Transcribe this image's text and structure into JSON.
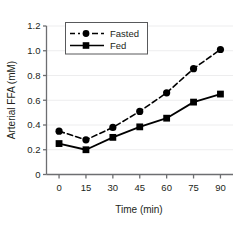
{
  "chart_data": {
    "type": "line",
    "title": "",
    "xlabel": "Time (min)",
    "ylabel": "Arterial FFA  (mM)",
    "x": [
      0,
      15,
      30,
      45,
      60,
      75,
      90
    ],
    "xtick_labels": [
      "0",
      "15",
      "30",
      "45",
      "60",
      "75",
      "90"
    ],
    "ytick_labels": [
      "0",
      "0.2",
      "0.4",
      "0.6",
      "0.8",
      "1.0",
      "1.2"
    ],
    "ytick_values": [
      0,
      0.2,
      0.4,
      0.6,
      0.8,
      1.0,
      1.2
    ],
    "xlim": [
      -7,
      97
    ],
    "ylim": [
      0,
      1.2
    ],
    "grid": "horizontal-faint",
    "legend_position": "upper-left-inside",
    "series": [
      {
        "name": "Fasted",
        "values": [
          0.35,
          0.28,
          0.38,
          0.51,
          0.66,
          0.855,
          1.01
        ],
        "linestyle": "dashed",
        "marker": "circle",
        "color": "#000000"
      },
      {
        "name": "Fed",
        "values": [
          0.25,
          0.2,
          0.3,
          0.385,
          0.455,
          0.585,
          0.65
        ],
        "linestyle": "solid",
        "marker": "square",
        "color": "#000000"
      }
    ]
  },
  "legend": {
    "items": [
      {
        "label": "Fasted"
      },
      {
        "label": "Fed"
      }
    ]
  },
  "colors": {
    "series": "#000000",
    "axis": "#6d6e71",
    "grid": "#ededee",
    "text": "#231f20",
    "background": "#ffffff"
  }
}
